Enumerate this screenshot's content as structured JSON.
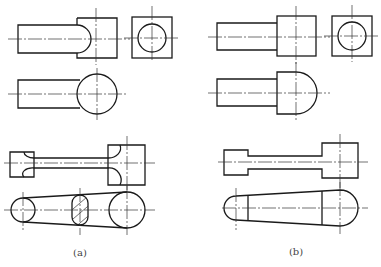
{
  "figure": {
    "panels": [
      {
        "id": "a",
        "label": "(a)",
        "description": "Views with cylindrical shaft into square block; connecting rod with hatched cross-section"
      },
      {
        "id": "b",
        "label": "(b)",
        "description": "Views with shaft into block with rounded end; tapered lever with rounded ends"
      }
    ]
  }
}
